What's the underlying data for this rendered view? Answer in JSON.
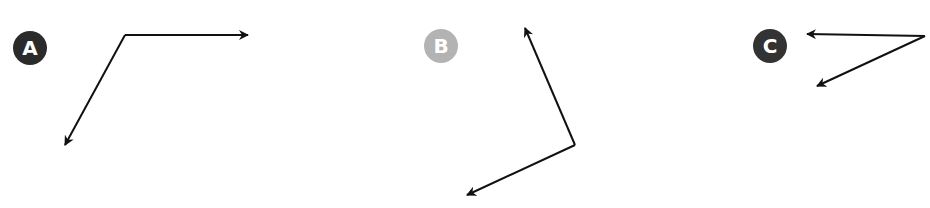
{
  "panels": [
    {
      "label": "A",
      "badge_color": "#2b2b2b",
      "badge_pos": [
        13,
        31
      ],
      "vertex": [
        125,
        35
      ],
      "arrows": [
        [
          248,
          35
        ],
        [
          65,
          145
        ]
      ]
    },
    {
      "label": "B",
      "badge_color": "#b3b3b3",
      "badge_pos": [
        424,
        29
      ],
      "vertex": [
        575,
        145
      ],
      "arrows": [
        [
          525,
          28
        ],
        [
          467,
          195
        ]
      ]
    },
    {
      "label": "C",
      "badge_color": "#333333",
      "badge_pos": [
        753,
        29
      ],
      "vertex": [
        925,
        36
      ],
      "arrows": [
        [
          807,
          34
        ],
        [
          817,
          86
        ]
      ]
    }
  ],
  "stroke_color": "#111111"
}
